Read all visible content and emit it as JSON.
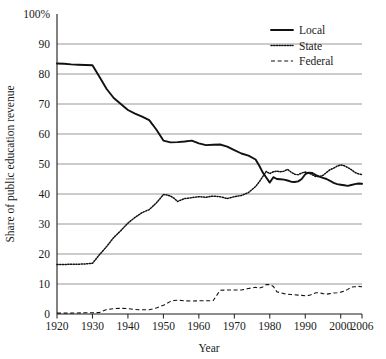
{
  "chart_data": {
    "type": "line",
    "title": "",
    "xlabel": "Year",
    "ylabel": "Share of public education revenue",
    "xlim": [
      1920,
      2006
    ],
    "ylim": [
      0,
      100
    ],
    "grid": true,
    "legend_position": "top-right",
    "xticks": [
      1920,
      1930,
      1940,
      1950,
      1960,
      1970,
      1980,
      1990,
      2000,
      2006
    ],
    "xtick_labels": [
      "1920",
      "1930",
      "1940",
      "1950",
      "1960",
      "1970",
      "1980",
      "1990",
      "2000",
      "2006"
    ],
    "yticks": [
      0,
      10,
      20,
      30,
      40,
      50,
      60,
      70,
      80,
      90,
      100
    ],
    "ytick_labels": [
      "0",
      "10",
      "20",
      "30",
      "40",
      "50",
      "60",
      "70",
      "80",
      "90",
      "100%"
    ],
    "series": [
      {
        "name": "Local",
        "style": "solid",
        "x": [
          1920,
          1922,
          1924,
          1926,
          1928,
          1930,
          1932,
          1934,
          1936,
          1938,
          1940,
          1942,
          1944,
          1946,
          1948,
          1950,
          1952,
          1954,
          1956,
          1958,
          1960,
          1962,
          1964,
          1966,
          1968,
          1970,
          1972,
          1974,
          1976,
          1977,
          1978,
          1979,
          1980,
          1981,
          1982,
          1983,
          1984,
          1985,
          1986,
          1987,
          1988,
          1989,
          1990,
          1991,
          1992,
          1993,
          1994,
          1995,
          1996,
          1997,
          1998,
          1999,
          2000,
          2001,
          2002,
          2003,
          2004,
          2005,
          2006
        ],
        "y": [
          83.5,
          83.4,
          83.2,
          83.1,
          83.0,
          82.9,
          79.0,
          75.0,
          72.0,
          70.0,
          68.0,
          66.8,
          65.8,
          64.6,
          61.5,
          57.8,
          57.2,
          57.3,
          57.5,
          57.8,
          56.9,
          56.3,
          56.4,
          56.5,
          55.8,
          54.6,
          53.5,
          52.8,
          51.5,
          49.5,
          47.2,
          45.5,
          43.8,
          45.6,
          45.0,
          44.9,
          44.8,
          44.5,
          44.1,
          44.0,
          44.2,
          45.0,
          46.6,
          47.1,
          47.0,
          46.3,
          45.8,
          45.4,
          45.0,
          44.4,
          43.7,
          43.3,
          43.1,
          42.9,
          42.7,
          43.0,
          43.3,
          43.5,
          43.4
        ]
      },
      {
        "name": "State",
        "style": "dotted",
        "x": [
          1920,
          1922,
          1924,
          1926,
          1928,
          1930,
          1932,
          1934,
          1936,
          1938,
          1940,
          1942,
          1944,
          1946,
          1948,
          1950,
          1951,
          1952,
          1953,
          1954,
          1955,
          1956,
          1957,
          1958,
          1960,
          1962,
          1964,
          1966,
          1968,
          1970,
          1972,
          1974,
          1976,
          1977,
          1978,
          1979,
          1980,
          1981,
          1982,
          1983,
          1984,
          1985,
          1986,
          1987,
          1988,
          1989,
          1990,
          1991,
          1992,
          1993,
          1994,
          1995,
          1996,
          1997,
          1998,
          1999,
          2000,
          2001,
          2002,
          2003,
          2004,
          2005,
          2006
        ],
        "y": [
          16.5,
          16.5,
          16.6,
          16.6,
          16.7,
          16.9,
          19.8,
          22.5,
          25.5,
          27.8,
          30.3,
          32.2,
          33.8,
          34.8,
          37.0,
          39.8,
          39.7,
          39.3,
          38.6,
          37.5,
          38.0,
          38.5,
          38.6,
          38.8,
          39.1,
          38.9,
          39.3,
          39.1,
          38.5,
          39.1,
          39.5,
          40.5,
          42.5,
          44.0,
          45.8,
          47.5,
          46.8,
          47.4,
          47.6,
          47.4,
          47.6,
          48.2,
          47.3,
          46.6,
          46.4,
          47.0,
          47.3,
          47.0,
          46.4,
          45.8,
          45.8,
          46.2,
          47.2,
          48.1,
          48.6,
          49.3,
          49.7,
          49.4,
          48.8,
          48.1,
          47.2,
          46.7,
          46.5
        ]
      },
      {
        "name": "Federal",
        "style": "dashed",
        "x": [
          1920,
          1924,
          1928,
          1930,
          1932,
          1934,
          1936,
          1938,
          1940,
          1942,
          1944,
          1946,
          1948,
          1950,
          1951,
          1952,
          1953,
          1954,
          1955,
          1956,
          1958,
          1960,
          1962,
          1964,
          1966,
          1968,
          1970,
          1972,
          1974,
          1976,
          1977,
          1978,
          1979,
          1980,
          1981,
          1982,
          1983,
          1984,
          1985,
          1986,
          1987,
          1988,
          1989,
          1990,
          1991,
          1992,
          1993,
          1994,
          1995,
          1996,
          1997,
          1998,
          1999,
          2000,
          2001,
          2002,
          2003,
          2004,
          2005,
          2006
        ],
        "y": [
          0.3,
          0.3,
          0.4,
          0.4,
          0.5,
          1.5,
          1.8,
          1.9,
          1.8,
          1.5,
          1.4,
          1.4,
          2.0,
          2.9,
          3.5,
          4.2,
          4.5,
          4.6,
          4.5,
          4.4,
          4.3,
          4.4,
          4.4,
          4.4,
          7.9,
          8.0,
          8.0,
          8.0,
          8.5,
          8.9,
          8.6,
          9.0,
          9.8,
          9.8,
          9.2,
          7.4,
          7.1,
          6.8,
          6.6,
          6.5,
          6.4,
          6.3,
          6.2,
          6.1,
          6.2,
          6.6,
          7.1,
          7.1,
          6.8,
          6.6,
          6.8,
          7.0,
          7.1,
          7.3,
          7.6,
          8.2,
          9.0,
          9.1,
          9.2,
          9.1
        ]
      }
    ]
  },
  "legend": {
    "items": [
      {
        "label": "Local"
      },
      {
        "label": "State"
      },
      {
        "label": "Federal"
      }
    ]
  },
  "colors": {
    "line": "#111111",
    "grid": "#8c8c8c",
    "frame": "#1a1a1a",
    "background": "#ffffff"
  }
}
